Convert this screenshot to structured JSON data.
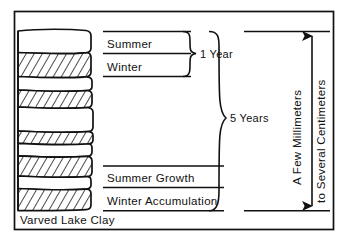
{
  "figure": {
    "caption": "Varved Lake Clay",
    "labels": {
      "summer": "Summer",
      "winter": "Winter",
      "one_year": "1 Year",
      "five_years": "5 Years",
      "summer_growth": "Summer Growth",
      "winter_accumulation": "Winter Accumulation",
      "thickness_line1": "A Few Millimeters",
      "thickness_line2": "to Several Centimeters"
    },
    "colors": {
      "ink": "#111111",
      "paper": "#ffffff"
    },
    "legend": {
      "white_band_meaning": "Summer Growth",
      "hatched_band_meaning": "Winter Accumulation"
    },
    "layers": [
      {
        "index": 1,
        "season": "summer",
        "fill": "white"
      },
      {
        "index": 2,
        "season": "winter",
        "fill": "hatched"
      },
      {
        "index": 3,
        "season": "summer",
        "fill": "white"
      },
      {
        "index": 4,
        "season": "winter",
        "fill": "hatched"
      },
      {
        "index": 5,
        "season": "summer",
        "fill": "white"
      },
      {
        "index": 6,
        "season": "winter",
        "fill": "hatched"
      },
      {
        "index": 7,
        "season": "summer",
        "fill": "white"
      },
      {
        "index": 8,
        "season": "winter",
        "fill": "hatched"
      },
      {
        "index": 9,
        "season": "summer",
        "fill": "white"
      },
      {
        "index": 10,
        "season": "winter",
        "fill": "hatched"
      }
    ],
    "annotations": {
      "year_count_total": "5 Years",
      "year_count_single": "1 Year"
    }
  }
}
